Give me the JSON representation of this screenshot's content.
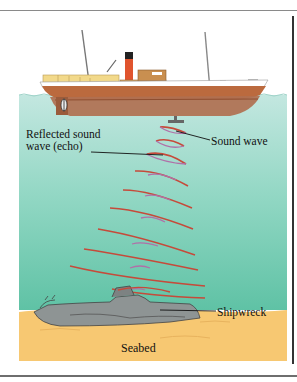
{
  "figure": {
    "labels": {
      "reflected_line1": "Reflected sound",
      "reflected_line2": "wave (echo)",
      "sound_wave": "Sound wave",
      "shipwreck": "Shipwreck",
      "seabed": "Seabed"
    },
    "colors": {
      "sky": "#ffffff",
      "water_top": "#bfe6de",
      "water_bottom": "#62c3a6",
      "seabed": "#f7c872",
      "hull": "#b8643a",
      "hull_under": "#a86a4a",
      "funnel": "#e0542e",
      "sound_wave": "#c64a3a",
      "echo_wave": "#b070a8",
      "wreck": "#8a8e8e"
    },
    "components": [
      "ship",
      "transducer",
      "sound-waves",
      "echo-waves",
      "shipwreck",
      "seabed",
      "water"
    ]
  }
}
